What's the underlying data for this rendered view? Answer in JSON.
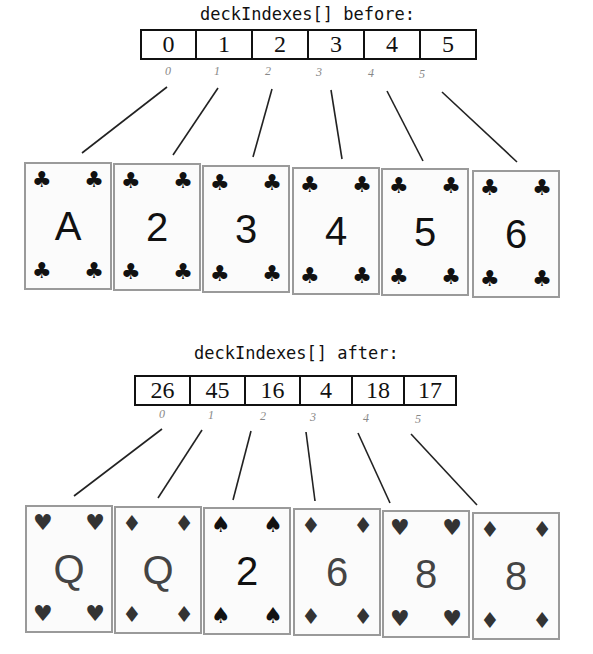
{
  "before": {
    "title": "deckIndexes[] before:",
    "values": [
      "0",
      "1",
      "2",
      "3",
      "4",
      "5"
    ],
    "indexes": [
      "0",
      "1",
      "2",
      "3",
      "4",
      "5"
    ],
    "cards": [
      {
        "rank": "A",
        "suit": "♣",
        "suit_name": "clubs"
      },
      {
        "rank": "2",
        "suit": "♣",
        "suit_name": "clubs"
      },
      {
        "rank": "3",
        "suit": "♣",
        "suit_name": "clubs"
      },
      {
        "rank": "4",
        "suit": "♣",
        "suit_name": "clubs"
      },
      {
        "rank": "5",
        "suit": "♣",
        "suit_name": "clubs"
      },
      {
        "rank": "6",
        "suit": "♣",
        "suit_name": "clubs"
      }
    ]
  },
  "after": {
    "title": "deckIndexes[] after:",
    "values": [
      "26",
      "45",
      "16",
      "4",
      "18",
      "17"
    ],
    "indexes": [
      "0",
      "1",
      "2",
      "3",
      "4",
      "5"
    ],
    "cards": [
      {
        "rank": "Q",
        "suit": "♥",
        "suit_name": "hearts"
      },
      {
        "rank": "Q",
        "suit": "♦",
        "suit_name": "diamonds"
      },
      {
        "rank": "2",
        "suit": "♠",
        "suit_name": "spades"
      },
      {
        "rank": "6",
        "suit": "♦",
        "suit_name": "diamonds"
      },
      {
        "rank": "8",
        "suit": "♥",
        "suit_name": "hearts"
      },
      {
        "rank": "8",
        "suit": "♦",
        "suit_name": "diamonds"
      }
    ]
  }
}
